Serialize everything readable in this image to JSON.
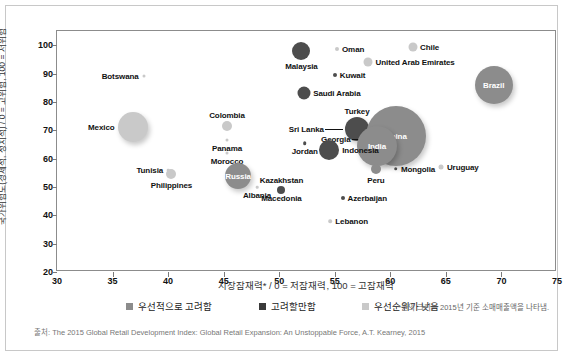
{
  "chart_data": {
    "type": "scatter",
    "title": "",
    "xlabel": "시장잠재력* / 0 = 저잠재력, 100 = 고잠재력",
    "ylabel": "국가위험도(경제적, 정치적) / 0 = 고위험, 100 = 저위험",
    "xlim": [
      30,
      75
    ],
    "ylim": [
      20,
      105
    ],
    "xticks": [
      30,
      35,
      40,
      45,
      50,
      55,
      60,
      65,
      70,
      75
    ],
    "yticks": [
      20,
      30,
      40,
      50,
      60,
      70,
      80,
      90,
      100
    ],
    "grid": false,
    "legend_position": "bottom",
    "note": "*원의 크기는 2015년 기준 소매매출액을 나타냄.",
    "source": "출처: The 2015 Global Retail Development Index: Global Retail Expansion: An Unstoppable Force, A.T. Kearney, 2015",
    "bubble_size_meaning": "원의 크기는 2015년 기준 소매매출액",
    "colors": {
      "priority": "#8c8c8c",
      "consider": "#4d4d4d",
      "low_priority": "#c9c9c9",
      "axis": "#8c8c8c",
      "label": "#111111"
    },
    "legend": [
      {
        "label": "우선적으로 고려함",
        "color": "#8c8c8c",
        "key": "priority"
      },
      {
        "label": "고려할만함",
        "color": "#3a3a3a",
        "key": "consider"
      },
      {
        "label": "우선순위가 낮음",
        "color": "#c9c9c9",
        "key": "low_priority"
      }
    ],
    "points": [
      {
        "name": "Malaysia",
        "x": 52.0,
        "y": 98.0,
        "r": 9,
        "group": "consider",
        "label_pos": "below",
        "label_inside": false
      },
      {
        "name": "Oman",
        "x": 55.2,
        "y": 98.5,
        "r": 2,
        "group": "low_priority",
        "label_pos": "right",
        "label_inside": false
      },
      {
        "name": "Chile",
        "x": 62.0,
        "y": 99.5,
        "r": 4.5,
        "group": "low_priority",
        "label_pos": "right",
        "label_inside": false
      },
      {
        "name": "United Arab Emirates",
        "x": 58.0,
        "y": 94.0,
        "r": 4.5,
        "group": "low_priority",
        "label_pos": "right",
        "label_inside": false
      },
      {
        "name": "Kuwait",
        "x": 55.0,
        "y": 89.5,
        "r": 2,
        "group": "consider",
        "label_pos": "right",
        "label_inside": false
      },
      {
        "name": "Botswana",
        "x": 37.8,
        "y": 89.0,
        "r": 1.5,
        "group": "low_priority",
        "label_pos": "left",
        "label_inside": false
      },
      {
        "name": "Saudi Arabia",
        "x": 52.2,
        "y": 83.0,
        "r": 6.5,
        "group": "consider",
        "label_pos": "right",
        "label_inside": false
      },
      {
        "name": "Colombia",
        "x": 45.3,
        "y": 71.5,
        "r": 5,
        "group": "low_priority",
        "label_pos": "above",
        "label_inside": false
      },
      {
        "name": "Mexico",
        "x": 36.8,
        "y": 71.0,
        "r": 15,
        "group": "low_priority",
        "label_pos": "left",
        "label_inside": false
      },
      {
        "name": "Turkey",
        "x": 57.0,
        "y": 70.5,
        "r": 12,
        "group": "consider",
        "label_pos": "above",
        "label_inside": false
      },
      {
        "name": "Sri Lanka",
        "x": 56.0,
        "y": 70.5,
        "r": 0,
        "group": "consider",
        "label_pos": "leader",
        "label_inside": false
      },
      {
        "name": "China",
        "x": 60.5,
        "y": 68.0,
        "r": 30,
        "group": "priority",
        "label_pos": "center",
        "label_inside": true
      },
      {
        "name": "Georgia",
        "x": 58.4,
        "y": 67.0,
        "r": 0,
        "group": "priority",
        "label_pos": "leader",
        "label_inside": false
      },
      {
        "name": "India",
        "x": 58.8,
        "y": 64.5,
        "r": 20,
        "group": "priority",
        "label_pos": "center",
        "label_inside": true
      },
      {
        "name": "Brazil",
        "x": 69.3,
        "y": 86.0,
        "r": 19,
        "group": "priority",
        "label_pos": "center",
        "label_inside": true
      },
      {
        "name": "Panama",
        "x": 45.3,
        "y": 66.5,
        "r": 1.5,
        "group": "low_priority",
        "label_pos": "below",
        "label_inside": false
      },
      {
        "name": "Jordan",
        "x": 52.3,
        "y": 65.5,
        "r": 1.8,
        "group": "consider",
        "label_pos": "below",
        "label_inside": false
      },
      {
        "name": "Indonesia",
        "x": 54.5,
        "y": 63.0,
        "r": 10,
        "group": "consider",
        "label_pos": "right",
        "label_inside": false
      },
      {
        "name": "Morocco",
        "x": 45.3,
        "y": 62.0,
        "r": 1.5,
        "group": "low_priority",
        "label_pos": "below",
        "label_inside": false
      },
      {
        "name": "Mongolia",
        "x": 60.5,
        "y": 56.5,
        "r": 1.8,
        "group": "consider",
        "label_pos": "right",
        "label_inside": false
      },
      {
        "name": "Uruguay",
        "x": 64.6,
        "y": 57.0,
        "r": 2.5,
        "group": "low_priority",
        "label_pos": "right",
        "label_inside": false
      },
      {
        "name": "Peru",
        "x": 58.7,
        "y": 56.5,
        "r": 5,
        "group": "priority",
        "label_pos": "below",
        "label_inside": false
      },
      {
        "name": "Tunisia",
        "x": 40.0,
        "y": 56.0,
        "r": 1.3,
        "group": "low_priority",
        "label_pos": "left",
        "label_inside": false
      },
      {
        "name": "Philippines",
        "x": 40.3,
        "y": 54.5,
        "r": 5,
        "group": "low_priority",
        "label_pos": "below",
        "label_inside": false
      },
      {
        "name": "Russia",
        "x": 46.3,
        "y": 54.0,
        "r": 13,
        "group": "priority",
        "label_pos": "center",
        "label_inside": true
      },
      {
        "name": "Kazakhstan",
        "x": 50.2,
        "y": 49.0,
        "r": 4,
        "group": "consider",
        "label_pos": "above",
        "label_inside": false
      },
      {
        "name": "Albania",
        "x": 48.0,
        "y": 50.0,
        "r": 1.3,
        "group": "low_priority",
        "label_pos": "below",
        "label_inside": false
      },
      {
        "name": "Macedonia",
        "x": 50.2,
        "y": 49.0,
        "r": 0,
        "group": "consider",
        "label_pos": "below",
        "label_inside": false
      },
      {
        "name": "Azerbaijan",
        "x": 55.7,
        "y": 46.0,
        "r": 2,
        "group": "consider",
        "label_pos": "right",
        "label_inside": false
      },
      {
        "name": "Lebanon",
        "x": 54.6,
        "y": 38.0,
        "r": 1.8,
        "group": "low_priority",
        "label_pos": "right",
        "label_inside": false
      }
    ]
  }
}
